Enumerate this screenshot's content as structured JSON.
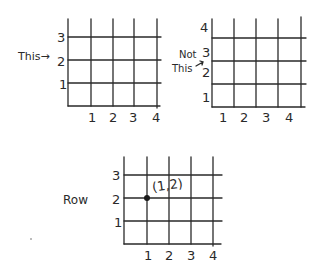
{
  "colors": {
    "ink": "#2a2a2a",
    "background": "#ffffff"
  },
  "grids": [
    {
      "id": "grid-this",
      "caption": "This→",
      "y_labels": [
        "3",
        "2",
        "1"
      ],
      "x_labels": [
        "1",
        "2",
        "3",
        "4"
      ],
      "annotation_target_row": "2"
    },
    {
      "id": "grid-not-this",
      "caption_line1": "Not",
      "caption_line2": "This",
      "y_labels": [
        "4",
        "3",
        "2",
        "1"
      ],
      "x_labels": [
        "1",
        "2",
        "3",
        "4"
      ],
      "annotation_target_row": "2"
    },
    {
      "id": "grid-row",
      "caption": "Row",
      "y_labels": [
        "3",
        "2",
        "1"
      ],
      "x_labels": [
        "1",
        "2",
        "3",
        "4"
      ],
      "point": {
        "x": 1,
        "y": 2,
        "label": "(1,2)"
      }
    }
  ]
}
